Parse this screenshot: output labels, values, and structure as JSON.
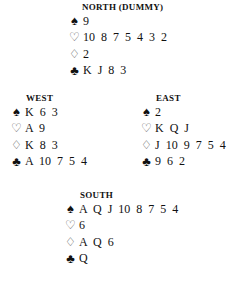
{
  "hands": {
    "north": {
      "label": "NORTH (DUMMY)",
      "spades": "9",
      "hearts": "10 8 7 5 4 3 2",
      "diamonds": "2",
      "clubs": "K J 8 3"
    },
    "west": {
      "label": "WEST",
      "spades": "K 6 3",
      "hearts": "A 9",
      "diamonds": "K 8 3",
      "clubs": "A 10 7 5 4"
    },
    "east": {
      "label": "EAST",
      "spades": "2",
      "hearts": "K Q J",
      "diamonds": "J 10 9 7 5 4",
      "clubs": "9 6 2"
    },
    "south": {
      "label": "SOUTH",
      "spades": "A Q J 10 8 7 5 4",
      "hearts": "6",
      "diamonds": "A Q 6",
      "clubs": "Q"
    }
  },
  "icons": {
    "spade": "♠",
    "heart": "♡",
    "diamond": "♢",
    "club": "♣"
  }
}
